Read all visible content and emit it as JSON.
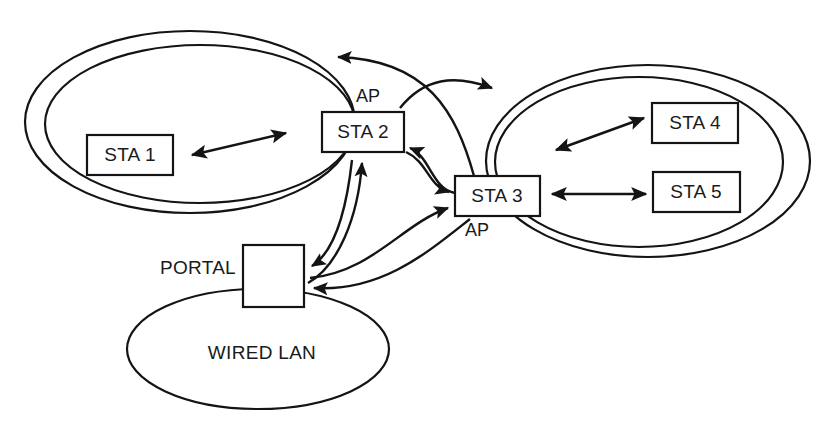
{
  "diagram": {
    "stroke_color": "#141414",
    "background_color": "#ffffff",
    "nodes": [
      {
        "id": "sta1",
        "label": "STA 1",
        "role": "station",
        "bss": "left"
      },
      {
        "id": "sta2",
        "label": "STA 2",
        "role": "access-point",
        "bss": "left",
        "role_label": "AP"
      },
      {
        "id": "sta3",
        "label": "STA 3",
        "role": "access-point",
        "bss": "right",
        "role_label": "AP"
      },
      {
        "id": "sta4",
        "label": "STA 4",
        "role": "station",
        "bss": "right"
      },
      {
        "id": "sta5",
        "label": "STA 5",
        "role": "station",
        "bss": "right"
      },
      {
        "id": "portal",
        "label": "",
        "role": "portal",
        "side_label": "PORTAL"
      }
    ],
    "clouds": [
      {
        "id": "bss-left",
        "label": "",
        "kind": "bss",
        "nested": true
      },
      {
        "id": "bss-right",
        "label": "",
        "kind": "bss",
        "nested": true
      },
      {
        "id": "wired-lan",
        "label": "WIRED LAN",
        "kind": "lan",
        "nested": false
      }
    ],
    "labels": {
      "sta1": "STA 1",
      "sta2": "STA 2",
      "sta3": "STA 3",
      "sta4": "STA 4",
      "sta5": "STA 5",
      "ap_left": "AP",
      "ap_right": "AP",
      "portal": "PORTAL",
      "wired_lan": "WIRED LAN"
    },
    "links": [
      {
        "from": "sta1",
        "to": "sta2",
        "style": "straight",
        "arrows": "both"
      },
      {
        "from": "sta3",
        "to": "sta4",
        "style": "straight",
        "arrows": "both"
      },
      {
        "from": "sta3",
        "to": "sta5",
        "style": "straight",
        "arrows": "both"
      },
      {
        "from": "sta2",
        "to": "bss-right",
        "style": "curved",
        "arrows": "forward"
      },
      {
        "from": "sta3",
        "to": "bss-left",
        "style": "curved",
        "arrows": "forward"
      },
      {
        "from": "sta3",
        "to": "sta2",
        "style": "curved",
        "arrows": "forward"
      },
      {
        "from": "sta2",
        "to": "sta3",
        "style": "curved",
        "arrows": "forward"
      },
      {
        "from": "portal",
        "to": "sta2",
        "style": "curved",
        "arrows": "forward"
      },
      {
        "from": "sta2",
        "to": "portal",
        "style": "curved",
        "arrows": "forward"
      },
      {
        "from": "portal",
        "to": "sta3",
        "style": "curved",
        "arrows": "forward"
      },
      {
        "from": "sta3",
        "to": "portal",
        "style": "curved",
        "arrows": "forward"
      }
    ]
  }
}
